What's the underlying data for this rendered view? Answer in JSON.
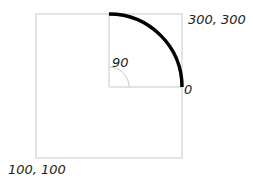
{
  "diagram": {
    "outer_box": {
      "top_right_label": "300, 300",
      "bottom_left_label": "100, 100"
    },
    "arc": {
      "start_angle_label": "0",
      "end_angle_label": "90"
    },
    "colors": {
      "box_stroke": "#c8c8c8",
      "arc_stroke": "#000000",
      "text": "#222222"
    }
  }
}
